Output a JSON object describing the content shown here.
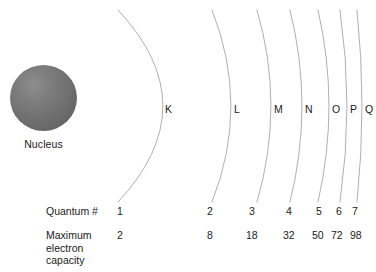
{
  "figure": {
    "background_color": "#ffffff",
    "arc_color": "#9a9a9a",
    "text_color": "#1a1a1a",
    "nucleus_color": "#707070"
  },
  "nucleus": {
    "label": "Nucleus"
  },
  "rows": {
    "quantum_label": "Quantum #",
    "capacity_label_line1": "Maximum",
    "capacity_label_line2": "electron",
    "capacity_label_line3": "capacity"
  },
  "shells": [
    {
      "letter": "K",
      "quantum_number": "1",
      "max_electron_capacity": "2",
      "label_x": 165,
      "number_x": 117,
      "capacity_x": 117,
      "arc_top_x": 118,
      "arc_apex_x": 163,
      "arc_bottom_x": 118
    },
    {
      "letter": "L",
      "quantum_number": "2",
      "max_electron_capacity": "8",
      "label_x": 234,
      "number_x": 207,
      "capacity_x": 207,
      "arc_top_x": 212,
      "arc_apex_x": 231,
      "arc_bottom_x": 212
    },
    {
      "letter": "M",
      "quantum_number": "3",
      "max_electron_capacity": "18",
      "label_x": 274,
      "number_x": 249,
      "capacity_x": 246,
      "arc_top_x": 257,
      "arc_apex_x": 271,
      "arc_bottom_x": 257
    },
    {
      "letter": "N",
      "quantum_number": "4",
      "max_electron_capacity": "32",
      "label_x": 305,
      "number_x": 286,
      "capacity_x": 283,
      "arc_top_x": 290,
      "arc_apex_x": 302,
      "arc_bottom_x": 290
    },
    {
      "letter": "O",
      "quantum_number": "5",
      "max_electron_capacity": "50",
      "label_x": 332,
      "number_x": 316,
      "capacity_x": 312,
      "arc_top_x": 318,
      "arc_apex_x": 329,
      "arc_bottom_x": 318
    },
    {
      "letter": "P",
      "quantum_number": "6",
      "max_electron_capacity": "72",
      "label_x": 350,
      "number_x": 336,
      "capacity_x": 331,
      "arc_top_x": 340,
      "arc_apex_x": 347,
      "arc_bottom_x": 340
    },
    {
      "letter": "Q",
      "quantum_number": "7",
      "max_electron_capacity": "98",
      "label_x": 365,
      "number_x": 352,
      "capacity_x": 350,
      "arc_top_x": 357,
      "arc_apex_x": 362,
      "arc_bottom_x": 357
    }
  ],
  "chart_data": {
    "type": "diagram",
    "categories": [
      "K",
      "L",
      "M",
      "N",
      "O",
      "P",
      "Q"
    ],
    "series": [
      {
        "name": "Quantum #",
        "values": [
          1,
          2,
          3,
          4,
          5,
          6,
          7
        ]
      },
      {
        "name": "Maximum electron capacity",
        "values": [
          2,
          8,
          18,
          32,
          50,
          72,
          98
        ]
      }
    ],
    "annotations": [
      "Nucleus"
    ],
    "grid": false,
    "legend": "none"
  }
}
